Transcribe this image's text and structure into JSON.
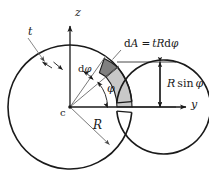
{
  "figure": {
    "center_label": "c",
    "axes": {
      "vertical_label": "z",
      "horizontal_label": "y"
    },
    "labels": {
      "thickness": "t",
      "radius": "R",
      "angle": "φ",
      "angle_increment_d": "d",
      "angle_increment_phi": "φ",
      "area_element": "dA = tRdφ",
      "area_element_d": "d",
      "area_element_A": "A",
      "area_element_eq": "=",
      "area_element_tR": "tR",
      "area_element_dphi": "dφ",
      "height_R": "R",
      "height_sin": "sin",
      "height_phi": "φ",
      "height_full": "R sin φ"
    },
    "colors": {
      "stroke": "#1a1a1a",
      "element_fill": "#808080",
      "sector_fill": "#c8c8c8",
      "leader": "#555555",
      "background": "#ffffff"
    },
    "geometry": {
      "center_x": 70,
      "center_y": 107,
      "outer_radius": 62,
      "inner_radius": 47,
      "mid_radius": 54.5,
      "phi_degrees": 40,
      "dphi_degrees": 13,
      "gap_degrees": 5
    }
  }
}
